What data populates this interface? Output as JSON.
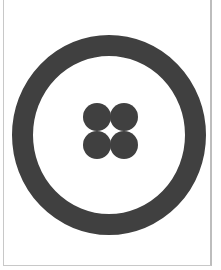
{
  "figure": {
    "colors": {
      "background": "#ffffff",
      "shape_fill": "#404040",
      "border": "#c8c8c8"
    },
    "ring": {
      "cx": 109,
      "cy": 135,
      "outer_rx": 97,
      "outer_ry": 100,
      "thickness": 21
    },
    "dots": [
      {
        "cx": 97,
        "cy": 117,
        "r": 14
      },
      {
        "cx": 124,
        "cy": 117,
        "r": 14
      },
      {
        "cx": 97,
        "cy": 145,
        "r": 14
      },
      {
        "cx": 124,
        "cy": 145,
        "r": 14
      }
    ]
  }
}
